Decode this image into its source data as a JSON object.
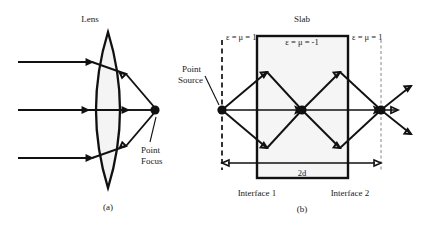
{
  "figure": {
    "panels": [
      {
        "id": "a",
        "caption": "(a)",
        "title": "Lens",
        "labels": {
          "point_focus_line1": "Point",
          "point_focus_line2": "Focus"
        },
        "description": "Conventional biconvex lens focusing three parallel incident rays to a point focus"
      },
      {
        "id": "b",
        "caption": "(b)",
        "title": "Slab",
        "labels": {
          "point_source_line1": "Point",
          "point_source_line2": "Source",
          "interface_1": "Interface 1",
          "interface_2": "Interface 2",
          "thickness": "2d"
        },
        "regions": [
          {
            "name": "left-vacuum",
            "constitutive": "ε = μ = 1"
          },
          {
            "name": "slab-medium",
            "constitutive": "ε = μ = -1"
          },
          {
            "name": "right-vacuum",
            "constitutive": "ε = μ = 1"
          }
        ],
        "description": "Negative-index slab producing an internal focus and an external focus via negative refraction"
      }
    ],
    "colors": {
      "ink": "#111111",
      "fill_light": "#f5f5f5",
      "dash_light": "#9a9a9a",
      "background": "#ffffff"
    }
  }
}
